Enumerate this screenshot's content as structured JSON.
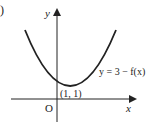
{
  "figure": {
    "part_marker": ")",
    "axes": {
      "x_label": "x",
      "y_label": "y",
      "origin_label": "O"
    },
    "curve": {
      "equation_label": "y = 3 − f(x)",
      "shape": "upward-opening parabola",
      "minimum_point_label": "(1, 1)"
    },
    "colors": {
      "ink": "#222222",
      "background": "#ffffff"
    }
  }
}
